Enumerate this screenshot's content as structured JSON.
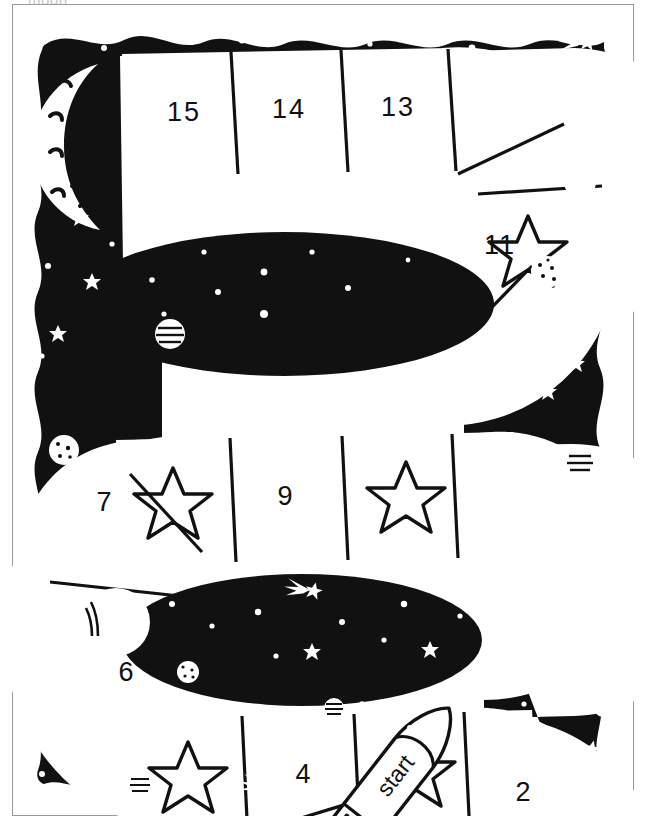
{
  "page": {
    "title_cut_off": "moon",
    "background_color": "#ffffff",
    "ink_color": "#111111",
    "space_color": "#111111",
    "path_color": "#ffffff"
  },
  "board": {
    "name": "space-board-game",
    "shape": "serpentine",
    "start_label": "start",
    "total_spaces": 15,
    "cells": [
      {
        "index": 1,
        "label": "1",
        "type": "number"
      },
      {
        "index": 2,
        "label": "2",
        "type": "number"
      },
      {
        "index": 3,
        "label": "",
        "type": "star"
      },
      {
        "index": 4,
        "label": "4",
        "type": "number"
      },
      {
        "index": 5,
        "label": "",
        "type": "star"
      },
      {
        "index": 6,
        "label": "6",
        "type": "number"
      },
      {
        "index": 7,
        "label": "7",
        "type": "number"
      },
      {
        "index": 8,
        "label": "",
        "type": "star"
      },
      {
        "index": 9,
        "label": "9",
        "type": "number"
      },
      {
        "index": 10,
        "label": "",
        "type": "star"
      },
      {
        "index": 11,
        "label": "11",
        "type": "number"
      },
      {
        "index": 12,
        "label": "",
        "type": "star"
      },
      {
        "index": 13,
        "label": "13",
        "type": "number"
      },
      {
        "index": 14,
        "label": "14",
        "type": "number"
      },
      {
        "index": 15,
        "label": "15",
        "type": "number"
      }
    ]
  },
  "decorations": {
    "moon": {
      "name": "crescent-moon",
      "position": "top-left"
    },
    "rocket": {
      "name": "rocket-ship",
      "label": "start",
      "position": "bottom-center"
    },
    "planets": 7,
    "stars": 34,
    "comets": 6
  }
}
